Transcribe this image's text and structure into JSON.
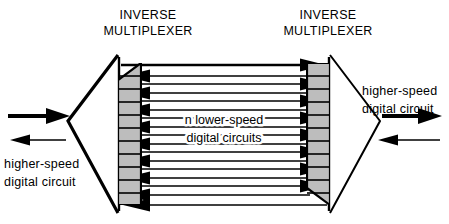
{
  "figure": {
    "background_color": "#ffffff",
    "line_color": "#000000",
    "fill_gray": "#bdbdbd"
  },
  "labels": {
    "left_mux_line1": "INVERSE",
    "left_mux_line2": "MULTIPLEXER",
    "right_mux_line1": "INVERSE",
    "right_mux_line2": "MULTIPLEXER",
    "center_line1": "n  lower-speed",
    "center_line2": "digital circuits",
    "left_circuit_line1": "higher-speed",
    "left_circuit_line2": "digital circuit",
    "right_circuit_line1": "higher-speed",
    "right_circuit_line2": "digital circuit"
  },
  "diagram_data": {
    "type": "diagram",
    "trunk_count": 14,
    "trunk_direction_pattern": "top line points right; remaining lines point left toward left multiplexer and right toward right multiplexer",
    "left_node": {
      "name": "left-inverse-multiplexer",
      "input_arrow": "thick arrow pointing right (into multiplexer)",
      "output_arrow": "thin arrow pointing left (out of multiplexer)"
    },
    "right_node": {
      "name": "right-inverse-multiplexer",
      "output_arrow": "thick arrow pointing right (out of multiplexer)",
      "input_arrow": "thin arrow pointing left (into multiplexer)"
    },
    "staircase_steps": 11
  }
}
